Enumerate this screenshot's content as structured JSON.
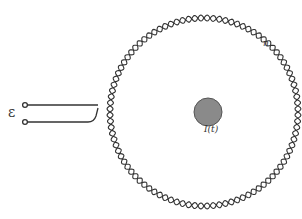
{
  "diagram": {
    "labels": {
      "emf": "ε",
      "turns": "n",
      "current": "I(t)"
    },
    "colors": {
      "wire": "#333333",
      "conductor_fill": "#8a8a8a",
      "conductor_stroke": "#555555",
      "background": "#ffffff"
    }
  }
}
